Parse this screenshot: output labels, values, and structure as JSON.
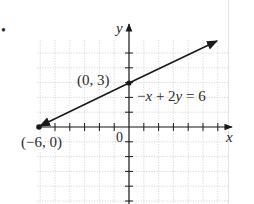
{
  "bullet": "•",
  "chart_data": {
    "type": "line",
    "title": "",
    "xlabel": "x",
    "ylabel": "y",
    "origin_label": "0",
    "equation": "−x + 2y = 6",
    "xlim": [
      -6.3,
      6.8
    ],
    "ylim": [
      -5.4,
      6.5
    ],
    "grid": true,
    "tick_step": 1,
    "series": [
      {
        "name": "−x + 2y = 6",
        "x": [
          -6,
          0,
          6
        ],
        "y": [
          0,
          3,
          6
        ],
        "arrows": "both"
      }
    ],
    "points": [
      {
        "label": "(0, 3)",
        "x": 0,
        "y": 3
      },
      {
        "label": "(−6, 0)",
        "x": -6,
        "y": 0
      }
    ]
  }
}
